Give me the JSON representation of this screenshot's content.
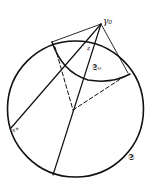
{
  "figure": {
    "colors": {
      "ink": "#111111",
      "background": "#ffffff"
    },
    "labels": {
      "apex": "γ₀",
      "point_z": "z",
      "inner_circle": "𝔖₀",
      "point_x_star": "x*",
      "outer_circle": "𝔖"
    }
  }
}
